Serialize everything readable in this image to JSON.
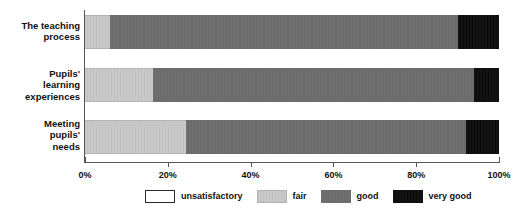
{
  "chart_data": {
    "type": "bar",
    "orientation": "horizontal",
    "stacked": true,
    "normalized": true,
    "title": "",
    "xlabel": "",
    "ylabel": "",
    "xlim": [
      0,
      100
    ],
    "grid": false,
    "legend_position": "bottom",
    "categories": [
      "The teaching process",
      "Pupils' learning experiences",
      "Meeting pupils' needs"
    ],
    "category_lines": [
      [
        "The teaching",
        "process"
      ],
      [
        "Pupils'",
        "learning",
        "experiences"
      ],
      [
        "Meeting",
        "pupils'",
        "needs"
      ]
    ],
    "tick_labels": [
      "0%",
      "20%",
      "40%",
      "60%",
      "80%",
      "100%"
    ],
    "tick_values": [
      0,
      20,
      40,
      60,
      80,
      100
    ],
    "series": [
      {
        "name": "unsatisfactory",
        "color": "#ffffff",
        "values": [
          0,
          0,
          0
        ]
      },
      {
        "name": "fair",
        "color": "#c9c9c9",
        "values": [
          6,
          16.5,
          24.5
        ]
      },
      {
        "name": "good",
        "color": "#6f6f6f",
        "values": [
          84,
          77.5,
          67.5
        ]
      },
      {
        "name": "very good",
        "color": "#111111",
        "values": [
          10,
          6,
          8
        ]
      }
    ]
  },
  "legend": {
    "items": [
      {
        "label": "unsatisfactory"
      },
      {
        "label": "fair"
      },
      {
        "label": "good"
      },
      {
        "label": "very good"
      }
    ]
  }
}
